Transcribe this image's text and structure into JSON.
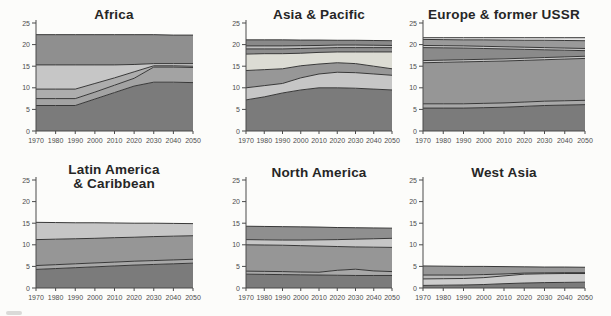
{
  "figure": {
    "background": "#fcfcfa",
    "boundary_line_color": "#383838",
    "axis_color": "#4a4a4a",
    "tick_label_color": "#4d4d4d",
    "title_color": "#262626"
  },
  "axes": {
    "x_tick_labels": [
      "1970",
      "1980",
      "1990",
      "2000",
      "2010",
      "2020",
      "2030",
      "2040",
      "2050"
    ],
    "y_tick_labels": [
      "0",
      "5",
      "10",
      "15",
      "20",
      "25"
    ],
    "y_tick_values": [
      0,
      5,
      10,
      15,
      20,
      25
    ],
    "y_min": 0,
    "y_max": 25,
    "grid": false,
    "legend": "none"
  },
  "chart_data": [
    {
      "type": "area",
      "title": "Africa",
      "title_lines": [
        "Africa"
      ],
      "x": [
        1970,
        1980,
        1990,
        2000,
        2010,
        2020,
        2030,
        2040,
        2050
      ],
      "ylim": [
        0,
        25
      ],
      "stacking": "values are cumulative layer tops, bottom layer first",
      "layers": [
        {
          "name": "layer-1",
          "color": "#7b7b7b",
          "top": [
            5.9,
            5.9,
            5.9,
            7.4,
            8.9,
            10.4,
            11.3,
            11.3,
            11.2
          ]
        },
        {
          "name": "layer-2",
          "color": "#a3a3a3",
          "top": [
            7.5,
            7.5,
            7.5,
            9.0,
            10.6,
            12.2,
            14.8,
            14.8,
            14.7
          ]
        },
        {
          "name": "layer-3",
          "color": "#adadad",
          "top": [
            9.7,
            9.7,
            9.7,
            11.0,
            12.3,
            13.7,
            15.1,
            15.1,
            15.0
          ]
        },
        {
          "name": "layer-4",
          "color": "#c6c6c6",
          "top": [
            15.3,
            15.3,
            15.3,
            15.3,
            15.3,
            15.4,
            15.6,
            15.6,
            15.6
          ]
        },
        {
          "name": "layer-5",
          "color": "#8f8f8f",
          "top": [
            22.3,
            22.3,
            22.3,
            22.3,
            22.3,
            22.3,
            22.3,
            22.2,
            22.2
          ]
        }
      ]
    },
    {
      "type": "area",
      "title": "Asia & Pacific",
      "title_lines": [
        "Asia & Pacific"
      ],
      "x": [
        1970,
        1980,
        1990,
        2000,
        2010,
        2020,
        2030,
        2040,
        2050
      ],
      "ylim": [
        0,
        25
      ],
      "stacking": "values are cumulative layer tops, bottom layer first",
      "layers": [
        {
          "name": "layer-1",
          "color": "#7b7b7b",
          "top": [
            7.2,
            7.9,
            8.8,
            9.5,
            10.0,
            10.0,
            9.9,
            9.7,
            9.5
          ]
        },
        {
          "name": "layer-2",
          "color": "#c6c6c6",
          "top": [
            10.0,
            10.5,
            11.0,
            12.3,
            13.2,
            13.6,
            13.5,
            13.2,
            12.9
          ]
        },
        {
          "name": "layer-3",
          "color": "#979797",
          "top": [
            14.0,
            14.2,
            14.4,
            15.1,
            15.5,
            15.8,
            15.6,
            15.0,
            14.4
          ]
        },
        {
          "name": "layer-4",
          "color": "#dcdcd4",
          "top": [
            17.8,
            17.9,
            17.9,
            18.0,
            18.2,
            18.3,
            18.3,
            18.3,
            18.3
          ]
        },
        {
          "name": "layer-5",
          "color": "#8d8d8d",
          "top": [
            19.0,
            19.0,
            19.0,
            19.1,
            19.2,
            19.3,
            19.3,
            19.3,
            19.3
          ]
        },
        {
          "name": "layer-6",
          "color": "#bdbdbd",
          "top": [
            19.7,
            19.7,
            19.7,
            19.75,
            19.8,
            19.9,
            19.9,
            19.85,
            19.8
          ]
        },
        {
          "name": "layer-7",
          "color": "#898989",
          "top": [
            21.1,
            21.1,
            21.1,
            21.05,
            21.05,
            21.0,
            21.0,
            20.95,
            20.9
          ]
        }
      ]
    },
    {
      "type": "area",
      "title": "Europe & former USSR",
      "title_lines": [
        "Europe & former USSR"
      ],
      "x": [
        1970,
        1980,
        1990,
        2000,
        2010,
        2020,
        2030,
        2040,
        2050
      ],
      "ylim": [
        0,
        25
      ],
      "stacking": "values are cumulative layer tops, bottom layer first",
      "layers": [
        {
          "name": "layer-1",
          "color": "#7b7b7b",
          "top": [
            5.3,
            5.3,
            5.3,
            5.4,
            5.5,
            5.7,
            5.9,
            6.0,
            6.1
          ]
        },
        {
          "name": "layer-2",
          "color": "#a8a8a8",
          "top": [
            6.3,
            6.3,
            6.3,
            6.4,
            6.5,
            6.7,
            6.9,
            7.0,
            7.1
          ]
        },
        {
          "name": "layer-3",
          "color": "#969696",
          "top": [
            15.8,
            15.9,
            16.0,
            16.1,
            16.2,
            16.35,
            16.5,
            16.65,
            16.8
          ]
        },
        {
          "name": "layer-4",
          "color": "#c9c9c9",
          "top": [
            16.3,
            16.4,
            16.5,
            16.6,
            16.7,
            16.85,
            17.0,
            17.15,
            17.3
          ]
        },
        {
          "name": "layer-5",
          "color": "#8a8a8a",
          "top": [
            19.3,
            19.25,
            19.2,
            19.1,
            19.0,
            18.9,
            18.8,
            18.7,
            18.6
          ]
        },
        {
          "name": "layer-6",
          "color": "#c9c9c9",
          "top": [
            19.8,
            19.75,
            19.7,
            19.6,
            19.5,
            19.4,
            19.3,
            19.2,
            19.1
          ]
        },
        {
          "name": "layer-7",
          "color": "#9a9a9a",
          "top": [
            21.2,
            21.15,
            21.1,
            21.1,
            21.05,
            21.0,
            21.0,
            20.95,
            20.9
          ]
        },
        {
          "name": "layer-8",
          "color": "#e7e7e7",
          "top": [
            21.6,
            21.6,
            21.6,
            21.6,
            21.6,
            21.6,
            21.6,
            21.6,
            21.6
          ]
        }
      ]
    },
    {
      "type": "area",
      "title": "Latin America & Caribbean",
      "title_lines": [
        "Latin America",
        "& Caribbean"
      ],
      "x": [
        1970,
        1980,
        1990,
        2000,
        2010,
        2020,
        2030,
        2040,
        2050
      ],
      "ylim": [
        0,
        25
      ],
      "stacking": "values are cumulative layer tops, bottom layer first",
      "layers": [
        {
          "name": "layer-1",
          "color": "#7b7b7b",
          "top": [
            4.3,
            4.5,
            4.7,
            4.9,
            5.1,
            5.3,
            5.45,
            5.6,
            5.75
          ]
        },
        {
          "name": "layer-2",
          "color": "#a8a8a8",
          "top": [
            5.2,
            5.4,
            5.6,
            5.8,
            6.0,
            6.2,
            6.35,
            6.5,
            6.65
          ]
        },
        {
          "name": "layer-3",
          "color": "#969696",
          "top": [
            11.2,
            11.3,
            11.4,
            11.5,
            11.65,
            11.75,
            11.9,
            12.0,
            12.1
          ]
        },
        {
          "name": "layer-4",
          "color": "#c6c6c6",
          "top": [
            15.2,
            15.15,
            15.1,
            15.1,
            15.05,
            15.0,
            15.0,
            14.95,
            14.9
          ]
        }
      ]
    },
    {
      "type": "area",
      "title": "North America",
      "title_lines": [
        "North America"
      ],
      "x": [
        1970,
        1980,
        1990,
        2000,
        2010,
        2020,
        2030,
        2040,
        2050
      ],
      "ylim": [
        0,
        25
      ],
      "stacking": "values are cumulative layer tops, bottom layer first",
      "layers": [
        {
          "name": "layer-1",
          "color": "#7b7b7b",
          "top": [
            3.2,
            3.15,
            3.1,
            3.05,
            3.0,
            2.95,
            2.9,
            2.9,
            2.9
          ]
        },
        {
          "name": "layer-2",
          "color": "#a8a8a8",
          "top": [
            3.9,
            3.85,
            3.8,
            3.7,
            3.65,
            4.1,
            4.35,
            3.95,
            3.8
          ]
        },
        {
          "name": "layer-3",
          "color": "#969696",
          "top": [
            10.0,
            9.95,
            9.9,
            9.8,
            9.7,
            9.6,
            9.5,
            9.45,
            9.4
          ]
        },
        {
          "name": "layer-4",
          "color": "#c6c6c6",
          "top": [
            11.2,
            11.15,
            11.1,
            11.1,
            11.15,
            11.2,
            11.3,
            11.4,
            11.5
          ]
        },
        {
          "name": "layer-5",
          "color": "#8f8f8f",
          "top": [
            14.3,
            14.25,
            14.2,
            14.15,
            14.1,
            14.0,
            13.95,
            13.9,
            13.85
          ]
        }
      ]
    },
    {
      "type": "area",
      "title": "West Asia",
      "title_lines": [
        "West Asia"
      ],
      "x": [
        1970,
        1980,
        1990,
        2000,
        2010,
        2020,
        2030,
        2040,
        2050
      ],
      "ylim": [
        0,
        25
      ],
      "stacking": "values are cumulative layer tops, bottom layer first",
      "layers": [
        {
          "name": "layer-1",
          "color": "#7b7b7b",
          "top": [
            0.6,
            0.65,
            0.7,
            0.8,
            1.0,
            1.15,
            1.25,
            1.3,
            1.35
          ]
        },
        {
          "name": "layer-2",
          "color": "#cdcdcd",
          "top": [
            2.1,
            2.15,
            2.2,
            2.4,
            2.8,
            3.2,
            3.3,
            3.35,
            3.35
          ]
        },
        {
          "name": "layer-3",
          "color": "#b8b8b8",
          "top": [
            3.0,
            3.0,
            3.0,
            3.1,
            3.25,
            3.45,
            3.5,
            3.55,
            3.55
          ]
        },
        {
          "name": "layer-4",
          "color": "#979797",
          "top": [
            5.1,
            5.05,
            5.0,
            5.0,
            4.95,
            4.9,
            4.85,
            4.85,
            4.8
          ]
        }
      ]
    }
  ]
}
